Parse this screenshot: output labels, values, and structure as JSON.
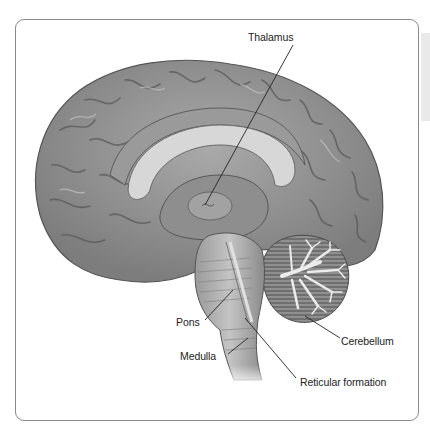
{
  "figure": {
    "colors": {
      "frame": "#8a8a8a",
      "brain_fill": "#8c8c8c",
      "brain_light": "#b8b8b8",
      "leader_line": "#222222"
    }
  },
  "labels": [
    {
      "id": "thalamus",
      "text": "Thalamus"
    },
    {
      "id": "pons",
      "text": "Pons"
    },
    {
      "id": "medulla",
      "text": "Medulla"
    },
    {
      "id": "cerebellum",
      "text": "Cerebellum"
    },
    {
      "id": "reticular-formation",
      "text": "Reticular formation"
    }
  ]
}
